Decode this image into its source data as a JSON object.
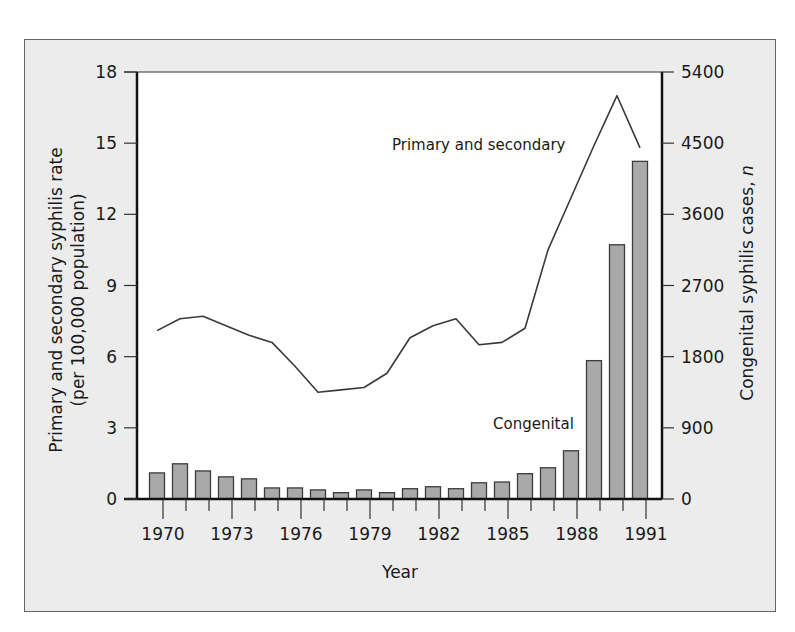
{
  "chart_data": {
    "type": "bar+line",
    "title": "",
    "xlabel": "Year",
    "ylabel_left": "Primary and secondary syphilis rate (per 100,000 population)",
    "ylabel_left_line1": "Primary and secondary syphilis rate",
    "ylabel_left_line2": "(per 100,000 population)",
    "ylabel_right": "Congenital syphilis cases, n",
    "ylabel_right_main": "Congenital syphilis cases, ",
    "ylabel_right_italic": "n",
    "ylim_left": [
      0,
      18
    ],
    "ylim_right": [
      0,
      5400
    ],
    "yticks_left": [
      0,
      3,
      6,
      9,
      12,
      15,
      18
    ],
    "yticks_right": [
      0,
      900,
      1800,
      2700,
      3600,
      4500,
      5400
    ],
    "xticks_labeled": [
      "1970",
      "1973",
      "1976",
      "1979",
      "1982",
      "1985",
      "1988",
      "1991"
    ],
    "categories": [
      1970,
      1971,
      1972,
      1973,
      1974,
      1975,
      1976,
      1977,
      1978,
      1979,
      1980,
      1981,
      1982,
      1983,
      1984,
      1985,
      1986,
      1987,
      1988,
      1989,
      1990,
      1991
    ],
    "grid": false,
    "legend": "inline annotations",
    "series": [
      {
        "name": "Primary and secondary",
        "type": "line",
        "axis": "left",
        "color": "#3a3a3a",
        "values": [
          7.1,
          7.6,
          7.7,
          7.3,
          6.9,
          6.6,
          5.6,
          4.5,
          4.6,
          4.7,
          5.3,
          6.8,
          7.3,
          7.6,
          6.5,
          6.6,
          7.2,
          10.5,
          12.7,
          14.9,
          17.0,
          14.8
        ]
      },
      {
        "name": "Congenital",
        "type": "bar",
        "axis": "right",
        "color": "#a9a9a9",
        "values": [
          330,
          445,
          355,
          280,
          255,
          140,
          140,
          115,
          80,
          115,
          80,
          130,
          155,
          130,
          205,
          215,
          320,
          395,
          610,
          1750,
          3215,
          4270
        ]
      }
    ],
    "annotations": [
      {
        "text": "Primary and secondary",
        "near": "line, 1986-1989"
      },
      {
        "text": "Congenital",
        "near": "bars, 1984-1987"
      }
    ]
  },
  "colors": {
    "frame_bg": "#ececec",
    "plot_bg": "#ffffff",
    "bar_fill": "#a9a9a9",
    "bar_stroke": "#3c3c3c",
    "line": "#3a3a3a",
    "axis": "#111111"
  }
}
